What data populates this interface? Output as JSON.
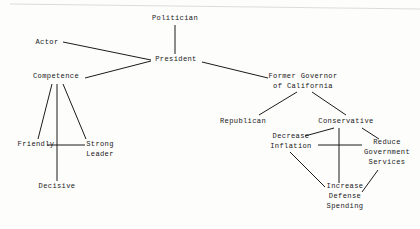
{
  "diagram": {
    "type": "concept-network",
    "background_color": "#fdfdfc",
    "line_color": "#1b1b1b",
    "text_color": "#1a1a1a",
    "nodes": [
      {
        "id": "politician",
        "label": "Politician",
        "lines": [
          "Politician"
        ],
        "x": 175,
        "y": 19
      },
      {
        "id": "president",
        "label": "President",
        "lines": [
          "President"
        ],
        "x": 176,
        "y": 60
      },
      {
        "id": "actor",
        "label": "Actor",
        "lines": [
          "Actor"
        ],
        "x": 47,
        "y": 43
      },
      {
        "id": "competence",
        "label": "Competence",
        "lines": [
          "Competence"
        ],
        "x": 56,
        "y": 77
      },
      {
        "id": "friendly",
        "label": "Friendly",
        "lines": [
          "Friendly"
        ],
        "x": 36,
        "y": 145
      },
      {
        "id": "strong-leader",
        "label": "Strong Leader",
        "lines": [
          "Strong",
          "Leader"
        ],
        "x": 100,
        "y": 150
      },
      {
        "id": "decisive",
        "label": "Decisive",
        "lines": [
          "Decisive"
        ],
        "x": 57,
        "y": 187
      },
      {
        "id": "former-governor",
        "label": "Former Governor of California",
        "lines": [
          "Former Governor",
          "of California"
        ],
        "x": 303,
        "y": 82
      },
      {
        "id": "republican",
        "label": "Republican",
        "lines": [
          "Republican"
        ],
        "x": 243,
        "y": 122
      },
      {
        "id": "conservative",
        "label": "Conservative",
        "lines": [
          "Conservative"
        ],
        "x": 346,
        "y": 122
      },
      {
        "id": "decrease-inflation",
        "label": "Decrease Inflation",
        "lines": [
          "Decrease",
          "Inflation"
        ],
        "x": 291,
        "y": 142
      },
      {
        "id": "reduce-government-services",
        "label": "Reduce Government Services",
        "lines": [
          "Reduce",
          "Government",
          "Services"
        ],
        "x": 387,
        "y": 153
      },
      {
        "id": "increase-defense-spending",
        "label": "Increase Defense Spending",
        "lines": [
          "Increase",
          "Defense",
          "Spending"
        ],
        "x": 345,
        "y": 197
      }
    ],
    "edges": [
      {
        "id": "politician-president",
        "from": "politician",
        "to": "president",
        "x1": 175,
        "y1": 25,
        "x2": 175,
        "y2": 54
      },
      {
        "id": "actor-president",
        "from": "actor",
        "to": "president",
        "x1": 63,
        "y1": 42,
        "x2": 151,
        "y2": 60
      },
      {
        "id": "competence-president",
        "from": "competence",
        "to": "president",
        "x1": 85,
        "y1": 78,
        "x2": 151,
        "y2": 61
      },
      {
        "id": "president-former-governor",
        "from": "president",
        "to": "former-governor",
        "x1": 202,
        "y1": 62,
        "x2": 268,
        "y2": 78
      },
      {
        "id": "competence-friendly",
        "from": "competence",
        "to": "friendly",
        "x1": 52,
        "y1": 84,
        "x2": 38,
        "y2": 139
      },
      {
        "id": "competence-decisive",
        "from": "competence",
        "to": "decisive",
        "x1": 57,
        "y1": 84,
        "x2": 57,
        "y2": 181
      },
      {
        "id": "competence-strong-leader",
        "from": "competence",
        "to": "strong-leader",
        "x1": 63,
        "y1": 84,
        "x2": 86,
        "y2": 139
      },
      {
        "id": "friendly-strong-leader",
        "from": "friendly",
        "to": "strong-leader",
        "x1": 47,
        "y1": 145,
        "x2": 85,
        "y2": 145
      },
      {
        "id": "governor-republican",
        "from": "former-governor",
        "to": "republican",
        "x1": 297,
        "y1": 92,
        "x2": 259,
        "y2": 115
      },
      {
        "id": "governor-conservative",
        "from": "former-governor",
        "to": "conservative",
        "x1": 312,
        "y1": 92,
        "x2": 346,
        "y2": 115
      },
      {
        "id": "conservative-decrease-inflation",
        "from": "conservative",
        "to": "decrease-inflation",
        "x1": 334,
        "y1": 128,
        "x2": 305,
        "y2": 136
      },
      {
        "id": "conservative-reduce-services",
        "from": "conservative",
        "to": "reduce-government-services",
        "x1": 362,
        "y1": 128,
        "x2": 379,
        "y2": 139
      },
      {
        "id": "conservative-increase-defense",
        "from": "conservative",
        "to": "increase-defense-spending",
        "x1": 339,
        "y1": 128,
        "x2": 339,
        "y2": 183
      },
      {
        "id": "decrease-inflation-reduce-services",
        "from": "decrease-inflation",
        "to": "reduce-government-services",
        "x1": 318,
        "y1": 145,
        "x2": 362,
        "y2": 145
      },
      {
        "id": "decrease-inflation-increase-defense",
        "from": "decrease-inflation",
        "to": "increase-defense-spending",
        "x1": 290,
        "y1": 152,
        "x2": 325,
        "y2": 187
      },
      {
        "id": "reduce-services-increase-defense",
        "from": "reduce-government-services",
        "to": "increase-defense-spending",
        "x1": 378,
        "y1": 170,
        "x2": 362,
        "y2": 192
      }
    ],
    "artifacts": [
      {
        "id": "scan-edge-line",
        "x1": 10,
        "y1": 4,
        "x2": 420,
        "y2": 9
      }
    ]
  }
}
